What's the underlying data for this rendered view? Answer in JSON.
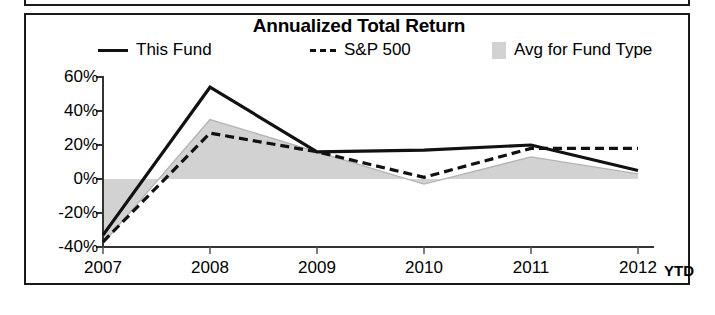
{
  "chart_data": {
    "type": "line",
    "title": "Annualized Total Return",
    "xlabel": "",
    "ylabel": "",
    "x": [
      "2007",
      "2008",
      "2009",
      "2010",
      "2011",
      "2012"
    ],
    "categories": [
      "2007",
      "2008",
      "2009",
      "2010",
      "2011",
      "2012"
    ],
    "x_axis_suffix": "YTD",
    "ylim": [
      -40,
      60
    ],
    "y_ticks": [
      60,
      40,
      20,
      0,
      -20,
      -40
    ],
    "y_tick_labels": [
      "60%",
      "40%",
      "20%",
      "0%",
      "-20%",
      "-40%"
    ],
    "grid": false,
    "legend_position": "top",
    "series": [
      {
        "name": "This Fund",
        "style": "solid",
        "color": "#111111",
        "values": [
          -33,
          54,
          16,
          17,
          20,
          5
        ]
      },
      {
        "name": "S&P 500",
        "style": "dashed",
        "color": "#111111",
        "values": [
          -37,
          27,
          16,
          1,
          18,
          18
        ]
      },
      {
        "name": "Avg for Fund Type",
        "style": "area",
        "color": "#d2d2d2",
        "values": [
          -38,
          35,
          16,
          -3,
          13,
          3
        ]
      }
    ]
  },
  "legend": {
    "items": [
      {
        "label": "This Fund",
        "swatch": "solid-line-swatch"
      },
      {
        "label": "S&P 500",
        "swatch": "dashed-line-swatch"
      },
      {
        "label": "Avg for Fund Type",
        "swatch": "shaded-area-swatch"
      }
    ]
  },
  "axis": {
    "y_labels": [
      "60%",
      "40%",
      "20%",
      "0%",
      "-20%",
      "-40%"
    ],
    "x_labels": [
      "2007",
      "2008",
      "2009",
      "2010",
      "2011",
      "2012"
    ],
    "x_suffix": "YTD"
  }
}
